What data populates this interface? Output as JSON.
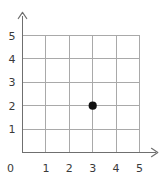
{
  "chart_data": {
    "type": "scatter",
    "title": "",
    "xlabel": "",
    "ylabel": "",
    "xlim": [
      0,
      5
    ],
    "ylim": [
      0,
      5
    ],
    "grid": true,
    "legend": null,
    "x_ticks": [
      "0",
      "1",
      "2",
      "3",
      "4",
      "5"
    ],
    "y_ticks": [
      "0",
      "1",
      "2",
      "3",
      "4",
      "5"
    ],
    "x_tick_values": [
      0,
      1,
      2,
      3,
      4,
      5
    ],
    "y_tick_values": [
      0,
      1,
      2,
      3,
      4,
      5
    ],
    "points": [
      {
        "label": "plotted-point",
        "x": 3,
        "y": 2
      }
    ],
    "series": [
      {
        "name": "point",
        "x": [
          3
        ],
        "y": [
          2
        ],
        "marker": "filled-circle",
        "color": "#111111"
      }
    ],
    "annotations": []
  },
  "style": {
    "background": "#ffffff",
    "grid_color": "#a9a9a9",
    "axis_color": "#6f6f6f",
    "point_color": "#111111",
    "label_color": "#3a3a3a"
  },
  "axes": {
    "x_axis_name": "x-axis",
    "y_axis_name": "y-axis",
    "x_arrow": "arrow-right",
    "y_arrow": "arrow-up"
  }
}
